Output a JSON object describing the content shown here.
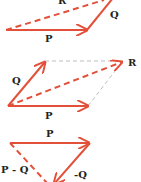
{
  "colors": {
    "vector": "#e2503a",
    "guide": "#bdbdbd",
    "label": "#222222",
    "background": "#ffffff"
  },
  "diagrams": [
    {
      "name": "triangle-addition",
      "labels": {
        "p": "P",
        "q": "Q",
        "r": "R"
      }
    },
    {
      "name": "parallelogram-addition",
      "labels": {
        "p": "P",
        "q": "Q",
        "r": "R"
      }
    },
    {
      "name": "triangle-subtraction",
      "labels": {
        "p": "P",
        "neg_q": "-Q",
        "diff": "P - Q"
      }
    }
  ]
}
